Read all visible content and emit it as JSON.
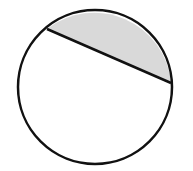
{
  "diagram": {
    "type": "circle-with-chord-shaded-segment",
    "background": "#ffffff",
    "circle": {
      "cx": 95,
      "cy": 87,
      "r": 77,
      "stroke": "#111111",
      "stroke_width": 2.5,
      "fill": "#ffffff"
    },
    "chord": {
      "x1": 47,
      "y1": 29,
      "x2": 171,
      "y2": 83,
      "stroke": "#111111",
      "stroke_width": 2.5
    },
    "shaded_segment": {
      "fill": "#d9d9d9",
      "description": "minor segment above chord"
    }
  }
}
